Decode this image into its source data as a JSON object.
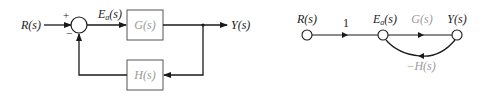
{
  "block_diagram": {
    "input_label": "R(s)",
    "error_label": "E",
    "error_subscript": "a",
    "error_suffix": "(s)",
    "forward_block": "G(s)",
    "feedback_block": "H(s)",
    "output_label": "Y(s)",
    "plus_sign": "+",
    "minus_sign": "−"
  },
  "signal_flow_graph": {
    "node_input_label": "R(s)",
    "branch_unity_gain": "1",
    "node_error_label": "E",
    "node_error_subscript": "a",
    "node_error_suffix": "(s)",
    "forward_gain": "G(s)",
    "node_output_label": "Y(s)",
    "feedback_gain": "−H(s)"
  },
  "colors": {
    "line": "#1a1a1a",
    "block_text": "#9a9a9a",
    "block_border": "#555555"
  }
}
